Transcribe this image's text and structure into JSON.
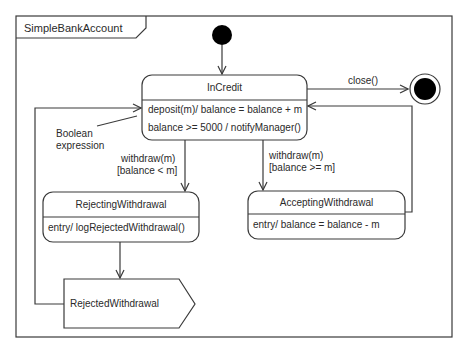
{
  "diagram": {
    "type": "uml-state-machine",
    "frame": {
      "title": "SimpleBankAccount"
    },
    "initial_state": {
      "icon": "initial-state-dot"
    },
    "final_state": {
      "icon": "final-state-bullseye"
    },
    "states": {
      "in_credit": {
        "name": "InCredit",
        "activities": [
          "deposit(m)/ balance = balance + m",
          "balance >= 5000 /  notifyManager()"
        ]
      },
      "rejecting_withdrawal": {
        "name": "RejectingWithdrawal",
        "activities": [
          "entry/  logRejectedWithdrawal()"
        ]
      },
      "accepting_withdrawal": {
        "name": "AcceptingWithdrawal",
        "activities": [
          "entry/ balance = balance  - m"
        ]
      }
    },
    "signal": {
      "name": "RejectedWithdrawal"
    },
    "transitions": {
      "close": {
        "label": "close()",
        "from": "InCredit",
        "to": "final"
      },
      "withdraw_reject": {
        "trigger": "withdraw(m)",
        "guard": "[balance < m]",
        "from": "InCredit",
        "to": "RejectingWithdrawal"
      },
      "withdraw_accept": {
        "trigger": "withdraw(m)",
        "guard": "[balance >= m]",
        "from": "InCredit",
        "to": "AcceptingWithdrawal"
      }
    },
    "annotation": {
      "line1": "Boolean",
      "line2": "expression"
    },
    "colors": {
      "stroke": "#3a3a3a",
      "fill": "#ffffff",
      "dot": "#000000"
    }
  }
}
